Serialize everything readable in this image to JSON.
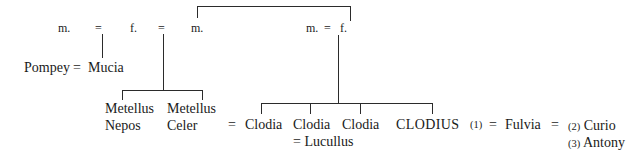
{
  "diagram": {
    "type": "genealogical-stemma",
    "background_color": "#ffffff",
    "line_color": "#2b2b2b",
    "text_color": "#1a1a1a"
  },
  "generation1": {
    "husband1_abbr": "m.",
    "marriage_sign1": "=",
    "wife_abbr": "f.",
    "marriage_sign2": "=",
    "husband2_abbr": "m.",
    "right_husband_abbr": "m.",
    "right_marriage_sign": "=",
    "right_wife_abbr": "f."
  },
  "pompey_line": {
    "husband": "Pompey",
    "marriage_sign": "=",
    "wife": "Mucia"
  },
  "metelli": [
    {
      "line1": "Metellus",
      "line2": "Nepos"
    },
    {
      "line1": "Metellus",
      "line2": "Celer"
    }
  ],
  "clodii": [
    {
      "marriage_sign": "=",
      "name": "Clodia",
      "spouse_line": ""
    },
    {
      "marriage_sign": "",
      "name": "Clodia",
      "spouse_line": "= Lucullus"
    },
    {
      "marriage_sign": "",
      "name": "Clodia",
      "spouse_line": ""
    }
  ],
  "clodius_line": {
    "name": "CLODIUS",
    "first_marriage_number": "(1)",
    "marriage_sign_left": "=",
    "wife": "Fulvia",
    "marriage_sign_right": "=",
    "later_marriages": [
      {
        "number": "(2)",
        "husband": "Curio"
      },
      {
        "number": "(3)",
        "husband": "Antony"
      }
    ]
  }
}
